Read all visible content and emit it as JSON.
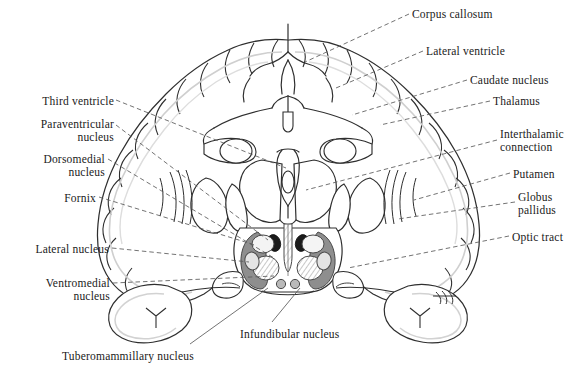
{
  "figure": {
    "ink_color": "#1a1a1a",
    "line_color": "#3a3a3a",
    "leader_color": "#555555"
  },
  "labels_left": [
    {
      "id": "third-ventricle",
      "text": "Third ventricle",
      "x": 18,
      "y": 95,
      "width": 96,
      "align": "r"
    },
    {
      "id": "paraventricular-nucleus",
      "text": "Paraventricular\nnucleus",
      "x": 2,
      "y": 118,
      "width": 112,
      "align": "r"
    },
    {
      "id": "dorsomedial-nucleus",
      "text": "Dorsomedial\nnucleus",
      "x": 2,
      "y": 153,
      "width": 103,
      "align": "r"
    },
    {
      "id": "fornix",
      "text": "Fornix",
      "x": 18,
      "y": 192,
      "width": 78,
      "align": "r"
    },
    {
      "id": "lateral-nucleus",
      "text": "Lateral nucleus",
      "x": 6,
      "y": 243,
      "width": 103,
      "align": "r"
    },
    {
      "id": "ventromedial-nucleus",
      "text": "Ventromedial\nnucleus",
      "x": 2,
      "y": 277,
      "width": 108,
      "align": "r"
    }
  ],
  "labels_right": [
    {
      "id": "corpus-callosum",
      "text": "Corpus callosum",
      "x": 412,
      "y": 8,
      "align": "l"
    },
    {
      "id": "lateral-ventricle",
      "text": "Lateral ventricle",
      "x": 426,
      "y": 45,
      "align": "l"
    },
    {
      "id": "caudate-nucleus",
      "text": "Caudate nucleus",
      "x": 470,
      "y": 74,
      "align": "l"
    },
    {
      "id": "thalamus",
      "text": "Thalamus",
      "x": 493,
      "y": 95,
      "align": "l"
    },
    {
      "id": "interthalamic-connection",
      "text": "Interthalamic\nconnection",
      "x": 500,
      "y": 128,
      "align": "l"
    },
    {
      "id": "putamen",
      "text": "Putamen",
      "x": 513,
      "y": 168,
      "align": "l"
    },
    {
      "id": "globus-pallidus",
      "text": "Globus\npallidus",
      "x": 518,
      "y": 191,
      "align": "l"
    },
    {
      "id": "optic-tract",
      "text": "Optic tract",
      "x": 512,
      "y": 231,
      "align": "l"
    }
  ],
  "labels_bottom": [
    {
      "id": "infundibular-nucleus",
      "text": "Infundibular nucleus",
      "x": 240,
      "y": 328,
      "align": "l"
    },
    {
      "id": "tuberomammillary-nucleus",
      "text": "Tuberomammillary nucleus",
      "x": 62,
      "y": 350,
      "align": "l"
    }
  ],
  "leaders_left": [
    {
      "id": "leader-third-ventricle",
      "from": [
        116,
        100
      ],
      "to": [
        286,
        168
      ]
    },
    {
      "id": "leader-paraventricular-nucleus",
      "from": [
        116,
        125
      ],
      "to": [
        268,
        240
      ]
    },
    {
      "id": "leader-dorsomedial-nucleus",
      "from": [
        108,
        159
      ],
      "to": [
        274,
        258
      ]
    },
    {
      "id": "leader-fornix",
      "from": [
        99,
        197
      ],
      "to": [
        255,
        245
      ]
    },
    {
      "id": "leader-lateral-nucleus",
      "from": [
        112,
        248
      ],
      "to": [
        249,
        262
      ]
    },
    {
      "id": "leader-ventromedial-nucleus",
      "from": [
        113,
        283
      ],
      "to": [
        274,
        276
      ]
    }
  ],
  "leaders_right": [
    {
      "id": "leader-corpus-callosum",
      "from": [
        409,
        14
      ],
      "to": [
        305,
        62
      ]
    },
    {
      "id": "leader-lateral-ventricle",
      "from": [
        423,
        51
      ],
      "to": [
        336,
        88
      ]
    },
    {
      "id": "leader-caudate-nucleus",
      "from": [
        467,
        80
      ],
      "to": [
        352,
        115
      ]
    },
    {
      "id": "leader-thalamus",
      "from": [
        490,
        101
      ],
      "to": [
        380,
        125
      ]
    },
    {
      "id": "leader-interthalamic-connection",
      "from": [
        497,
        140
      ],
      "to": [
        306,
        190
      ]
    },
    {
      "id": "leader-putamen",
      "from": [
        510,
        173
      ],
      "to": [
        414,
        200
      ]
    },
    {
      "id": "leader-globus-pallidus",
      "from": [
        515,
        202
      ],
      "to": [
        398,
        219
      ]
    },
    {
      "id": "leader-optic-tract",
      "from": [
        509,
        236
      ],
      "to": [
        348,
        268
      ]
    }
  ],
  "leaders_bottom": [
    {
      "id": "leader-infundibular-nucleus",
      "from": [
        272,
        322
      ],
      "to": [
        300,
        288
      ]
    },
    {
      "id": "leader-tuberomammillary-nucleus",
      "from": [
        190,
        344
      ],
      "to": [
        268,
        288
      ]
    }
  ],
  "anatomy": {
    "nuclei": [
      {
        "id": "lateral-nucleus-left",
        "name": "lateral nucleus (left)",
        "fill": "#8e8e8e",
        "side": "left"
      },
      {
        "id": "lateral-nucleus-right",
        "name": "lateral nucleus (right)",
        "fill": "#8e8e8e",
        "side": "right"
      },
      {
        "id": "paraventricular-left",
        "name": "paraventricular nucleus (left)",
        "fill": "#1b1b1b",
        "side": "left"
      },
      {
        "id": "paraventricular-right",
        "name": "paraventricular nucleus (right)",
        "fill": "#1b1b1b",
        "side": "right"
      },
      {
        "id": "dorsomedial-left",
        "name": "dorsomedial nucleus (left)",
        "fill": "#f2f2f2",
        "side": "left"
      },
      {
        "id": "dorsomedial-right",
        "name": "dorsomedial nucleus (right)",
        "fill": "#f2f2f2",
        "side": "right"
      },
      {
        "id": "ventromedial-left",
        "name": "ventromedial nucleus (left)",
        "fill": "hatch",
        "side": "left"
      },
      {
        "id": "ventromedial-right",
        "name": "ventromedial nucleus (right)",
        "fill": "hatch",
        "side": "right"
      },
      {
        "id": "third-ventricle-midline",
        "name": "third ventricle",
        "fill": "hatch",
        "side": "midline"
      },
      {
        "id": "infundibular-left",
        "name": "infundibular nucleus (left)",
        "fill": "#b5b5b5",
        "side": "left"
      },
      {
        "id": "infundibular-right",
        "name": "infundibular nucleus (right)",
        "fill": "#b5b5b5",
        "side": "right"
      },
      {
        "id": "fornix-left",
        "name": "fornix (left)",
        "fill": "#d8d8d8",
        "side": "left"
      },
      {
        "id": "fornix-right",
        "name": "fornix (right)",
        "fill": "#d8d8d8",
        "side": "right"
      }
    ]
  }
}
